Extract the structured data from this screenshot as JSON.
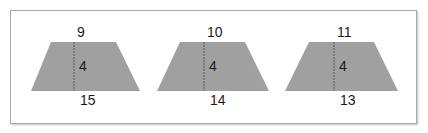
{
  "diagram": {
    "type": "trapezoids",
    "fill_color": "#a0a0a0",
    "height_line_color": "#555555",
    "trapezoids": [
      {
        "top_base": "9",
        "height": "4",
        "bottom_base": "15",
        "points": {
          "tl": [
            51,
            42
          ],
          "tr": [
            116,
            42
          ],
          "br": [
            140,
            91
          ],
          "bl": [
            31,
            91
          ]
        },
        "height_line_x": 74
      },
      {
        "top_base": "10",
        "height": "4",
        "bottom_base": "14",
        "points": {
          "tl": [
            180,
            42
          ],
          "tr": [
            245,
            42
          ],
          "br": [
            269,
            91
          ],
          "bl": [
            157,
            91
          ]
        },
        "height_line_x": 204
      },
      {
        "top_base": "11",
        "height": "4",
        "bottom_base": "13",
        "points": {
          "tl": [
            309,
            42
          ],
          "tr": [
            374,
            42
          ],
          "br": [
            398,
            91
          ],
          "bl": [
            285,
            91
          ]
        },
        "height_line_x": 334
      }
    ]
  }
}
